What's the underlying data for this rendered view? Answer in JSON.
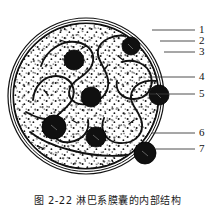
{
  "figure": {
    "caption": "图 2-22   淋巴系膜囊的内部结构",
    "labels": [
      {
        "id": "1",
        "text": "1",
        "num_x": 199,
        "num_y": 25,
        "line_x1": 152,
        "line_x2": 195,
        "line_y": 30
      },
      {
        "id": "2",
        "text": "2",
        "num_x": 199,
        "num_y": 36,
        "line_x1": 160,
        "line_x2": 195,
        "line_y": 41
      },
      {
        "id": "3",
        "text": "3",
        "num_x": 199,
        "num_y": 47,
        "line_x1": 164,
        "line_x2": 195,
        "line_y": 52
      },
      {
        "id": "4",
        "text": "4",
        "num_x": 199,
        "num_y": 72,
        "line_x1": 148,
        "line_x2": 195,
        "line_y": 77
      },
      {
        "id": "5",
        "text": "5",
        "num_x": 199,
        "num_y": 89,
        "line_x1": 150,
        "line_x2": 195,
        "line_y": 94
      },
      {
        "id": "6",
        "text": "6",
        "num_x": 199,
        "num_y": 128,
        "line_x1": 152,
        "line_x2": 195,
        "line_y": 133
      },
      {
        "id": "7",
        "text": "7",
        "num_x": 199,
        "num_y": 144,
        "line_x1": 156,
        "line_x2": 195,
        "line_y": 149
      }
    ],
    "colors": {
      "ink": "#111111",
      "paper": "#ffffff",
      "nucleus": "#101010",
      "stipple": "#1a1a1a"
    },
    "capsule": {
      "center_x": 86,
      "center_y": 96,
      "radius_outer": 78,
      "radius_inner": 73
    },
    "nuclei": [
      {
        "cx": 131,
        "cy": 46,
        "r": 9
      },
      {
        "cx": 74,
        "cy": 60,
        "r": 10
      },
      {
        "cx": 91,
        "cy": 97,
        "r": 10
      },
      {
        "cx": 159,
        "cy": 95,
        "r": 10
      },
      {
        "cx": 54,
        "cy": 127,
        "r": 12
      },
      {
        "cx": 96,
        "cy": 137,
        "r": 10
      },
      {
        "cx": 145,
        "cy": 153,
        "r": 11
      }
    ]
  }
}
